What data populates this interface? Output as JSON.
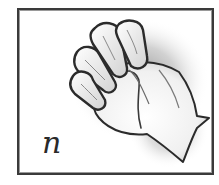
{
  "card": {
    "letter": "n",
    "subject": "hand-sign-letter-n",
    "colors": {
      "border": "#3a3a3a",
      "outline": "#2b2b2b",
      "shadow": "#8c8c8c",
      "background": "#ffffff"
    }
  }
}
